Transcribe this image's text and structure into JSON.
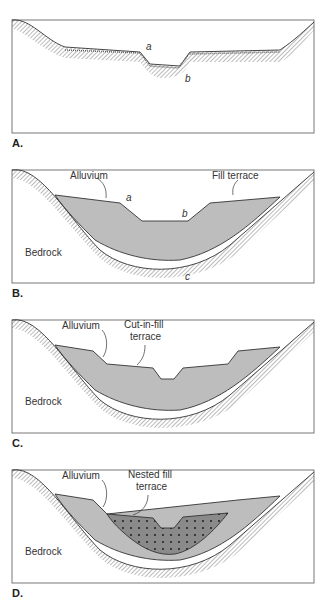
{
  "panels": [
    {
      "id": "A",
      "label": "A.",
      "annotations": {
        "a": "a",
        "b": "b"
      }
    },
    {
      "id": "B",
      "label": "B.",
      "annotations": {
        "alluvium": "Alluvium",
        "fill_terrace": "Fill terrace",
        "bedrock": "Bedrock",
        "a": "a",
        "b": "b",
        "c": "c"
      }
    },
    {
      "id": "C",
      "label": "C.",
      "annotations": {
        "alluvium": "Alluvium",
        "terrace_line1": "Cut-in-fill",
        "terrace_line2": "terrace",
        "bedrock": "Bedrock"
      }
    },
    {
      "id": "D",
      "label": "D.",
      "annotations": {
        "alluvium": "Alluvium",
        "terrace_line1": "Nested fill",
        "terrace_line2": "terrace",
        "bedrock": "Bedrock"
      }
    }
  ],
  "colors": {
    "alluvium": "#bdbdbd",
    "nested_fill": "#8a8a8a",
    "outline": "#444444"
  }
}
